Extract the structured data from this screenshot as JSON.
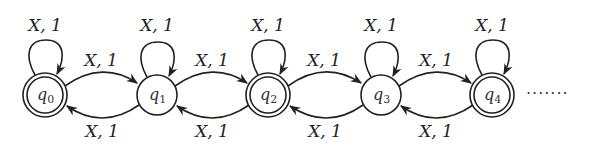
{
  "diagram": {
    "type": "finite-state-automaton",
    "states": [
      {
        "id": "q0",
        "name": "q",
        "sub": "0",
        "cx": 45,
        "cy": 95,
        "accepting": true
      },
      {
        "id": "q1",
        "name": "q",
        "sub": "1",
        "cx": 157,
        "cy": 95,
        "accepting": false
      },
      {
        "id": "q2",
        "name": "q",
        "sub": "2",
        "cx": 268,
        "cy": 95,
        "accepting": true
      },
      {
        "id": "q3",
        "name": "q",
        "sub": "3",
        "cx": 381,
        "cy": 95,
        "accepting": false
      },
      {
        "id": "q4",
        "name": "q",
        "sub": "4",
        "cx": 492,
        "cy": 95,
        "accepting": true
      }
    ],
    "self_loops": [
      {
        "state": "q0",
        "label": "X, 1"
      },
      {
        "state": "q1",
        "label": "X, 1"
      },
      {
        "state": "q2",
        "label": "X, 1"
      },
      {
        "state": "q3",
        "label": "X, 1"
      },
      {
        "state": "q4",
        "label": "X, 1"
      }
    ],
    "forward_edges": [
      {
        "from": "q0",
        "to": "q1",
        "label": "X, 1"
      },
      {
        "from": "q1",
        "to": "q2",
        "label": "X, 1"
      },
      {
        "from": "q2",
        "to": "q3",
        "label": "X, 1"
      },
      {
        "from": "q3",
        "to": "q4",
        "label": "X, 1"
      }
    ],
    "backward_edges": [
      {
        "from": "q1",
        "to": "q0",
        "label": "X, 1"
      },
      {
        "from": "q2",
        "to": "q1",
        "label": "X, 1"
      },
      {
        "from": "q3",
        "to": "q2",
        "label": "X, 1"
      },
      {
        "from": "q4",
        "to": "q3",
        "label": "X, 1"
      }
    ],
    "continuation": "·······"
  }
}
